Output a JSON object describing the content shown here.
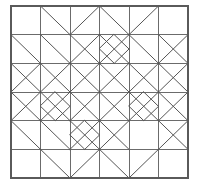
{
  "figure": {
    "title": "",
    "kind": "quilt-block-line-diagram",
    "background_color": "#ffffff",
    "grid_line_color": "#6b6b6b",
    "border_line_color": "#5a5a5a",
    "diagonal_line_color": "#555555",
    "grid": {
      "columns": 6,
      "rows": 6,
      "x0": 11,
      "y0": 6,
      "x1": 188,
      "y1": 178,
      "cell_width": 29.5,
      "cell_height": 28.6667
    },
    "chart_data": {
      "type": "table",
      "title": "Quilt block line diagram geometry",
      "xlabel": "grid column (0-6)",
      "ylabel": "grid row (0-6)",
      "xlim": [
        0,
        6
      ],
      "ylim": [
        0,
        6
      ],
      "grid": true,
      "legend_position": "none",
      "categories": [
        "grid-verticals",
        "grid-horizontals",
        "diagonals"
      ],
      "values": [
        7,
        7,
        48
      ],
      "series": [
        {
          "name": "grid-verticals",
          "values": [
            0,
            1,
            2,
            3,
            4,
            5,
            6
          ]
        },
        {
          "name": "grid-horizontals",
          "values": [
            0,
            1,
            2,
            3,
            4,
            5,
            6
          ]
        }
      ],
      "diagonals": [
        [
          1,
          0,
          2,
          1
        ],
        [
          3,
          0,
          2,
          1
        ],
        [
          3,
          0,
          4,
          1
        ],
        [
          5,
          0,
          4,
          1
        ],
        [
          0,
          1,
          1,
          2
        ],
        [
          1,
          1,
          2,
          2
        ],
        [
          2,
          1,
          3,
          2
        ],
        [
          3,
          1,
          2,
          2
        ],
        [
          3,
          1,
          4,
          2
        ],
        [
          4,
          1,
          3,
          2
        ],
        [
          5,
          1,
          6,
          2
        ],
        [
          4,
          1,
          5,
          2
        ],
        [
          6,
          1,
          5,
          2
        ],
        [
          0,
          2,
          1,
          3
        ],
        [
          1,
          2,
          0,
          3
        ],
        [
          1,
          2,
          2,
          3
        ],
        [
          2,
          2,
          1,
          3
        ],
        [
          2,
          2,
          3,
          3
        ],
        [
          3,
          2,
          2,
          3
        ],
        [
          3,
          2,
          4,
          3
        ],
        [
          4,
          2,
          3,
          3
        ],
        [
          4,
          2,
          5,
          3
        ],
        [
          5,
          2,
          4,
          3
        ],
        [
          5,
          2,
          6,
          3
        ],
        [
          6,
          2,
          5,
          3
        ],
        [
          0,
          3,
          1,
          4
        ],
        [
          1,
          3,
          0,
          4
        ],
        [
          1,
          3,
          2,
          4
        ],
        [
          2,
          3,
          1,
          4
        ],
        [
          2,
          3,
          3,
          4
        ],
        [
          3,
          3,
          2,
          4
        ],
        [
          3,
          3,
          4,
          4
        ],
        [
          4,
          3,
          3,
          4
        ],
        [
          4,
          3,
          5,
          4
        ],
        [
          5,
          3,
          4,
          4
        ],
        [
          5,
          3,
          6,
          4
        ],
        [
          6,
          3,
          5,
          4
        ],
        [
          0,
          4,
          1,
          5
        ],
        [
          1,
          4,
          2,
          5
        ],
        [
          2,
          4,
          3,
          5
        ],
        [
          3,
          4,
          2,
          5
        ],
        [
          3,
          4,
          4,
          5
        ],
        [
          4,
          4,
          3,
          5
        ],
        [
          5,
          4,
          6,
          5
        ],
        [
          6,
          4,
          5,
          5
        ],
        [
          1,
          5,
          2,
          6
        ],
        [
          3,
          5,
          2,
          6
        ],
        [
          3,
          5,
          4,
          6
        ],
        [
          5,
          5,
          4,
          6
        ]
      ],
      "inset_diamonds": [
        {
          "cx": 3.5,
          "cy": 1.5,
          "r": 0.5
        },
        {
          "cx": 1.5,
          "cy": 3.5,
          "r": 0.5
        },
        {
          "cx": 4.5,
          "cy": 3.5,
          "r": 0.5
        },
        {
          "cx": 2.5,
          "cy": 4.5,
          "r": 0.5
        }
      ]
    }
  }
}
